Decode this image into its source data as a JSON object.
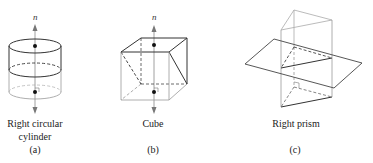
{
  "figures": [
    {
      "id": "a",
      "shape": "Right circular cylinder",
      "caption_lines": [
        "Right circular",
        "cylinder"
      ],
      "tag": "(a)",
      "normal_label": "n"
    },
    {
      "id": "b",
      "shape": "Cube",
      "caption_lines": [
        "Cube"
      ],
      "tag": "(b)",
      "normal_label": "n"
    },
    {
      "id": "c",
      "shape": "Right prism",
      "caption_lines": [
        "Right prism"
      ],
      "tag": "(c)"
    }
  ],
  "colors": {
    "dark_line": "#333333",
    "light_line": "#9a9a9a",
    "background": "#ffffff"
  }
}
